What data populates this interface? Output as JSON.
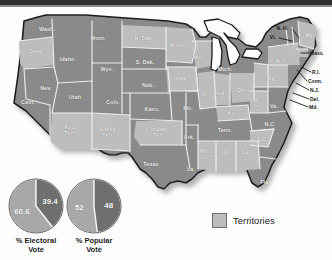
{
  "figure": {
    "kind": "election-map",
    "colors": {
      "state_fill": "#8a8a8a",
      "territory_fill": "#bdbdbd",
      "border": "#ededed",
      "outline": "#1c1c1c",
      "label": "#f2f2f2",
      "shadow": "#c9c9c9",
      "topbar": "#2e2e2e"
    }
  },
  "map": {
    "states": [
      {
        "id": "wash",
        "label": "Wash.",
        "x": 47,
        "y": 23,
        "size": "norm"
      },
      {
        "id": "oreg",
        "label": "Oreg.",
        "x": 36,
        "y": 45,
        "size": "norm"
      },
      {
        "id": "calif",
        "label": "Calif.",
        "x": 28,
        "y": 96,
        "size": "norm"
      },
      {
        "id": "nev",
        "label": "Nev.",
        "x": 46,
        "y": 82,
        "size": "norm"
      },
      {
        "id": "idaho",
        "label": "Idaho",
        "x": 67,
        "y": 53,
        "size": "norm"
      },
      {
        "id": "utah",
        "label": "Utah",
        "x": 75,
        "y": 91,
        "size": "norm"
      },
      {
        "id": "ariz",
        "label": "Ariz.\nTerr.",
        "x": 70,
        "y": 124,
        "size": "norm"
      },
      {
        "id": "mont",
        "label": "Mont.",
        "x": 98,
        "y": 32,
        "size": "norm"
      },
      {
        "id": "wyo",
        "label": "Wyo.",
        "x": 107,
        "y": 63,
        "size": "norm"
      },
      {
        "id": "colo",
        "label": "Colo.",
        "x": 113,
        "y": 96,
        "size": "norm"
      },
      {
        "id": "nmex",
        "label": "N.Mex.\nTerr.",
        "x": 108,
        "y": 126,
        "size": "norm"
      },
      {
        "id": "ndak",
        "label": "N. Dak.",
        "x": 144,
        "y": 32,
        "size": "norm"
      },
      {
        "id": "sdak",
        "label": "S. Dak.",
        "x": 145,
        "y": 56,
        "size": "norm"
      },
      {
        "id": "neb",
        "label": "Neb.",
        "x": 148,
        "y": 79,
        "size": "norm"
      },
      {
        "id": "kans",
        "label": "Kans.",
        "x": 152,
        "y": 103,
        "size": "norm"
      },
      {
        "id": "indter",
        "label": "Indian\nTerr.",
        "x": 159,
        "y": 126,
        "size": "norm"
      },
      {
        "id": "texas",
        "label": "Texas",
        "x": 151,
        "y": 158,
        "size": "norm"
      },
      {
        "id": "minn",
        "label": "Minn.",
        "x": 177,
        "y": 39,
        "size": "norm"
      },
      {
        "id": "iowa",
        "label": "Iowa",
        "x": 180,
        "y": 72,
        "size": "norm"
      },
      {
        "id": "mo",
        "label": "Mo.",
        "x": 188,
        "y": 102,
        "size": "norm"
      },
      {
        "id": "ark",
        "label": "Ark.",
        "x": 189,
        "y": 131,
        "size": "norm"
      },
      {
        "id": "la",
        "label": "La.",
        "x": 191,
        "y": 163,
        "size": "norm"
      },
      {
        "id": "wis",
        "label": "Wis.",
        "x": 199,
        "y": 51,
        "size": "norm"
      },
      {
        "id": "ill",
        "label": "Ill.",
        "x": 205,
        "y": 88,
        "size": "norm"
      },
      {
        "id": "mich",
        "label": "Mich.",
        "x": 225,
        "y": 63,
        "size": "norm"
      },
      {
        "id": "ind",
        "label": "Ind.",
        "x": 221,
        "y": 87,
        "size": "norm"
      },
      {
        "id": "ohio",
        "label": "Ohio",
        "x": 243,
        "y": 84,
        "size": "norm"
      },
      {
        "id": "ky",
        "label": "Ky.",
        "x": 232,
        "y": 107,
        "size": "norm"
      },
      {
        "id": "tenn",
        "label": "Tenn.",
        "x": 225,
        "y": 124,
        "size": "norm"
      },
      {
        "id": "miss",
        "label": "Miss.",
        "x": 207,
        "y": 145,
        "size": "norm"
      },
      {
        "id": "ala",
        "label": "Ala.",
        "x": 225,
        "y": 146,
        "size": "norm"
      },
      {
        "id": "ga",
        "label": "Ga.",
        "x": 246,
        "y": 146,
        "size": "norm"
      },
      {
        "id": "fla",
        "label": "Fla.",
        "x": 265,
        "y": 176,
        "size": "norm"
      },
      {
        "id": "sc",
        "label": "S.C.",
        "x": 262,
        "y": 133,
        "size": "norm"
      },
      {
        "id": "nc",
        "label": "N.C.",
        "x": 270,
        "y": 118,
        "size": "norm"
      },
      {
        "id": "wva",
        "label": "W.\nVa.",
        "x": 257,
        "y": 97,
        "size": "tiny"
      },
      {
        "id": "va",
        "label": "Va.",
        "x": 274,
        "y": 100,
        "size": "norm"
      },
      {
        "id": "pa",
        "label": "Pa.",
        "x": 272,
        "y": 73,
        "size": "norm"
      },
      {
        "id": "ny",
        "label": "N.Y.",
        "x": 281,
        "y": 55,
        "size": "norm"
      },
      {
        "id": "me",
        "label": "Me.",
        "x": 310,
        "y": 29,
        "size": "norm"
      }
    ],
    "callouts": [
      {
        "id": "nh",
        "label": "N. H.",
        "x": 288,
        "y": 21,
        "align": "right",
        "lx1": 293,
        "ly1": 23,
        "lx2": 299,
        "ly2": 31
      },
      {
        "id": "vt",
        "label": "Vt.",
        "x": 276,
        "y": 30,
        "align": "right",
        "lx1": 279,
        "ly1": 31,
        "lx2": 292,
        "ly2": 34
      },
      {
        "id": "mass",
        "label": "Mass.",
        "x": 310,
        "y": 46,
        "align": "left",
        "lx1": 309,
        "ly1": 46,
        "lx2": 301,
        "ly2": 46
      },
      {
        "id": "ri",
        "label": "R.I.",
        "x": 312,
        "y": 65,
        "align": "left",
        "lx1": 311,
        "ly1": 65,
        "lx2": 301,
        "ly2": 60
      },
      {
        "id": "conn",
        "label": "Conn.",
        "x": 308,
        "y": 74,
        "align": "left",
        "lx1": 307,
        "ly1": 74,
        "lx2": 297,
        "ly2": 63
      },
      {
        "id": "nj",
        "label": "N.J.",
        "x": 310,
        "y": 83,
        "align": "left",
        "lx1": 309,
        "ly1": 83,
        "lx2": 296,
        "ly2": 76
      },
      {
        "id": "del",
        "label": "Del.",
        "x": 310,
        "y": 92,
        "align": "left",
        "lx1": 309,
        "ly1": 92,
        "lx2": 293,
        "ly2": 86
      },
      {
        "id": "md",
        "label": "Md.",
        "x": 309,
        "y": 100,
        "align": "left",
        "lx1": 308,
        "ly1": 100,
        "lx2": 290,
        "ly2": 93
      }
    ]
  },
  "pies": [
    {
      "id": "electoral",
      "caption": "% Electoral\nVote",
      "slices": [
        {
          "label": "60.6",
          "value": 60.6,
          "color": "#a8a8a8"
        },
        {
          "label": "39.4",
          "value": 39.4,
          "color": "#6f6f6f"
        }
      ]
    },
    {
      "id": "popular",
      "caption": "% Popular\nVote",
      "slices": [
        {
          "label": "52",
          "value": 52,
          "color": "#a8a8a8"
        },
        {
          "label": "48",
          "value": 48,
          "color": "#6f6f6f"
        }
      ]
    }
  ],
  "legend": {
    "label": "Territories",
    "swatch_color": "#bdbdbd"
  }
}
